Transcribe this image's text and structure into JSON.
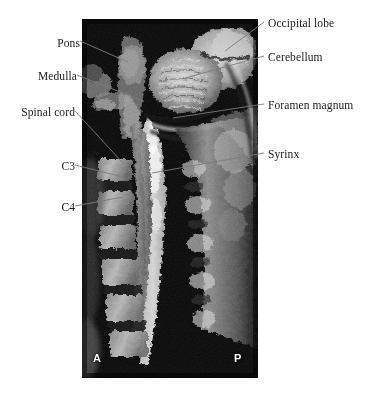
{
  "figure": {
    "type": "medical-image",
    "modality": "MRI",
    "view": "sagittal",
    "region": "cervical spine and posterior fossa",
    "panel": {
      "left": 82,
      "top": 19,
      "width": 176,
      "height": 359
    }
  },
  "orientation_markers": [
    {
      "id": "anterior",
      "label": "A",
      "x": 11,
      "y": 334
    },
    {
      "id": "posterior",
      "label": "P",
      "x": 152,
      "y": 334
    }
  ],
  "annotations": [
    {
      "id": "pons",
      "label": "Pons",
      "side": "left",
      "text_x": 48,
      "text_y": 44,
      "line": {
        "x1": 80,
        "y1": 41,
        "x2": 128,
        "y2": 62
      }
    },
    {
      "id": "medulla",
      "label": "Medulla",
      "side": "left",
      "text_x": 27,
      "text_y": 77,
      "line": {
        "x1": 77,
        "y1": 75,
        "x2": 143,
        "y2": 101
      }
    },
    {
      "id": "spinal-cord",
      "label": "Spinal cord",
      "side": "left",
      "text_x": 14,
      "text_y": 113,
      "line": {
        "x1": 75,
        "y1": 111,
        "x2": 146,
        "y2": 188
      }
    },
    {
      "id": "c3",
      "label": "C3",
      "side": "left",
      "text_x": 56,
      "text_y": 167,
      "line": {
        "x1": 75,
        "y1": 165,
        "x2": 123,
        "y2": 177
      }
    },
    {
      "id": "c4",
      "label": "C4",
      "side": "left",
      "text_x": 56,
      "text_y": 208,
      "line": {
        "x1": 75,
        "y1": 206,
        "x2": 123,
        "y2": 197
      }
    },
    {
      "id": "occipital-lobe",
      "label": "Occipital lobe",
      "side": "right",
      "text_x": 268,
      "text_y": 24,
      "line": {
        "x1": 264,
        "y1": 22,
        "x2": 225,
        "y2": 51
      }
    },
    {
      "id": "cerebellum",
      "label": "Cerebellum",
      "side": "right",
      "text_x": 268,
      "text_y": 58,
      "line": {
        "x1": 264,
        "y1": 56,
        "x2": 182,
        "y2": 79
      }
    },
    {
      "id": "foramen-magnum",
      "label": "Foramen magnum",
      "side": "right",
      "text_x": 268,
      "text_y": 106,
      "line": {
        "x1": 264,
        "y1": 104,
        "x2": 173,
        "y2": 118
      }
    },
    {
      "id": "syrinx",
      "label": "Syrinx",
      "side": "right",
      "text_x": 268,
      "text_y": 155,
      "line": {
        "x1": 264,
        "y1": 153,
        "x2": 152,
        "y2": 173
      }
    }
  ],
  "colors": {
    "background": "#ffffff",
    "label_text": "#1a1a1a",
    "leader_line": "#7a7a7a",
    "marker_text": "#ffffff",
    "panel_background": "#050505"
  }
}
